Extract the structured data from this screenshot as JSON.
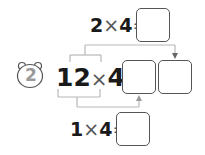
{
  "problem": {
    "number": "2",
    "badge_icon": "bear-head-icon",
    "main_expression": {
      "left": "12",
      "op": "×",
      "right": "4",
      "eq": "="
    },
    "top_partial": {
      "left": "2",
      "op": "×",
      "right": "4",
      "eq": "="
    },
    "bottom_partial": {
      "left": "1",
      "op": "×",
      "right": "4",
      "eq": "="
    },
    "answer_boxes": {
      "top": "",
      "bottom": "",
      "result_tens": "",
      "result_ones": ""
    }
  },
  "colors": {
    "text": "#1a1a1a",
    "operator": "#555555",
    "bracket_lines": "#b8b8b8",
    "box_border": "#555555",
    "badge_number": "#9a9a9a"
  }
}
